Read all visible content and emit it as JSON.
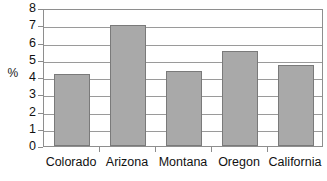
{
  "chart_data": {
    "type": "bar",
    "title": "",
    "subtitle": "",
    "xlabel": "",
    "ylabel": "%",
    "categories": [
      "Colorado",
      "Arizona",
      "Montana",
      "Oregon",
      "California"
    ],
    "values": [
      4.2,
      7.0,
      4.35,
      5.5,
      4.7
    ],
    "series": [
      {
        "name": "",
        "values": [
          4.2,
          7.0,
          4.35,
          5.5,
          4.7
        ]
      }
    ],
    "ylim": [
      0,
      8
    ],
    "ytick_labels": [
      "8",
      "7",
      "6",
      "5",
      "4",
      "3",
      "2",
      "1",
      "0"
    ],
    "ytick_values": [
      8,
      7,
      6,
      5,
      4,
      3,
      2,
      1,
      0
    ],
    "grid": true,
    "grid_axis": "y",
    "legend": false,
    "legend_position": "none",
    "colors": {
      "bar_fill": "#a9a9a9",
      "bar_border": "#7a7a7a",
      "gridline": "#9a9a9a",
      "axis": "#8e8e8e",
      "text": "#111111",
      "background": "#ffffff"
    }
  }
}
